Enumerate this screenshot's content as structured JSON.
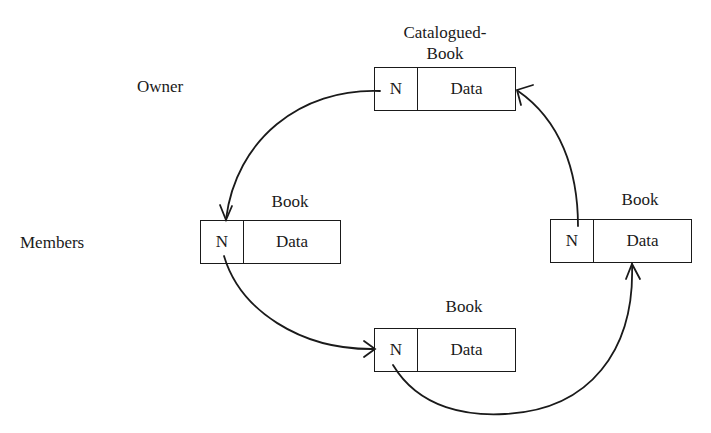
{
  "diagram": {
    "side_labels": {
      "owner": "Owner",
      "members": "Members"
    },
    "records": [
      {
        "id": "catalogued-book",
        "title_line1": "Catalogued-",
        "title_line2": "Book",
        "pointer": "N",
        "data": "Data"
      },
      {
        "id": "book-left",
        "title": "Book",
        "pointer": "N",
        "data": "Data"
      },
      {
        "id": "book-bottom",
        "title": "Book",
        "pointer": "N",
        "data": "Data"
      },
      {
        "id": "book-right",
        "title": "Book",
        "pointer": "N",
        "data": "Data"
      }
    ],
    "links": [
      {
        "from": "catalogued-book",
        "to": "book-left"
      },
      {
        "from": "book-left",
        "to": "book-bottom"
      },
      {
        "from": "book-bottom",
        "to": "book-right"
      },
      {
        "from": "book-right",
        "to": "catalogued-book"
      }
    ],
    "colors": {
      "ink": "#1a1a1a",
      "background": "#ffffff"
    }
  }
}
